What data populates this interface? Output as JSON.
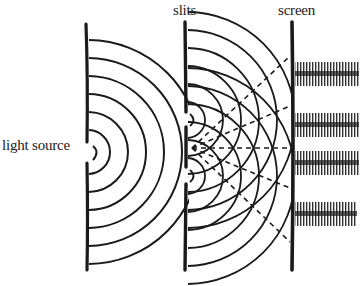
{
  "diagram": {
    "type": "double-slit interference experiment",
    "labels": {
      "light_source": "light source",
      "slits": "slits",
      "screen": "screen"
    },
    "barriers": [
      {
        "name": "source barrier",
        "x": 87,
        "y_top": 24,
        "y_bottom": 270,
        "opening_y": 152
      },
      {
        "name": "slit barrier",
        "x": 186,
        "y_top": 22,
        "y_bottom": 270,
        "openings_y": [
          120,
          176
        ]
      },
      {
        "name": "screen",
        "x": 293,
        "y_top": 22,
        "y_bottom": 270
      }
    ],
    "source_wavefronts_count": 6,
    "slit_wavefronts_count": 6,
    "dashed_rays_count": 5,
    "fringes_y": [
      73,
      125,
      162,
      213
    ],
    "colors": {
      "ink": "#1a1a1a",
      "background": "#ffffff"
    }
  }
}
